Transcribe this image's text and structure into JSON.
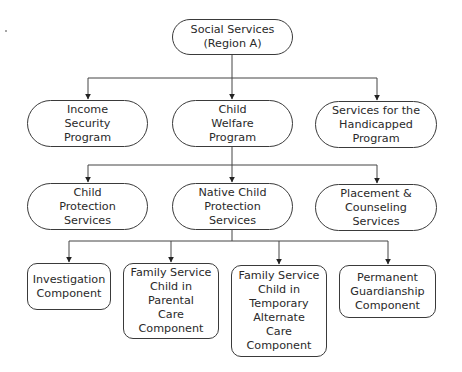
{
  "diagram": {
    "type": "organizational-chart",
    "root": {
      "label": "Social Services\n(Region A)"
    },
    "level1": [
      {
        "label": "Income\nSecurity\nProgram"
      },
      {
        "label": "Child\nWelfare\nProgram"
      },
      {
        "label": "Services for the\nHandicapped\nProgram"
      }
    ],
    "level2": [
      {
        "label": "Child\nProtection\nServices"
      },
      {
        "label": "Native Child\nProtection\nServices"
      },
      {
        "label": "Placement &\nCounseling\nServices"
      }
    ],
    "level3": [
      {
        "label": "Investigation\nComponent"
      },
      {
        "label": "Family Service\nChild in\nParental\nCare\nComponent"
      },
      {
        "label": "Family Service\nChild in\nTemporary\nAlternate\nCare\nComponent"
      },
      {
        "label": "Permanent\nGuardianship\nComponent"
      }
    ],
    "edges": [
      [
        "Social Services (Region A)",
        "Income Security Program"
      ],
      [
        "Social Services (Region A)",
        "Child Welfare Program"
      ],
      [
        "Social Services (Region A)",
        "Services for the Handicapped Program"
      ],
      [
        "Child Welfare Program",
        "Child Protection Services"
      ],
      [
        "Child Welfare Program",
        "Native Child Protection Services"
      ],
      [
        "Child Welfare Program",
        "Placement & Counseling Services"
      ],
      [
        "Native Child Protection Services",
        "Investigation Component"
      ],
      [
        "Native Child Protection Services",
        "Family Service Child in Parental Care Component"
      ],
      [
        "Native Child Protection Services",
        "Family Service Child in Temporary Alternate Care Component"
      ],
      [
        "Native Child Protection Services",
        "Permanent Guardianship Component"
      ]
    ]
  }
}
